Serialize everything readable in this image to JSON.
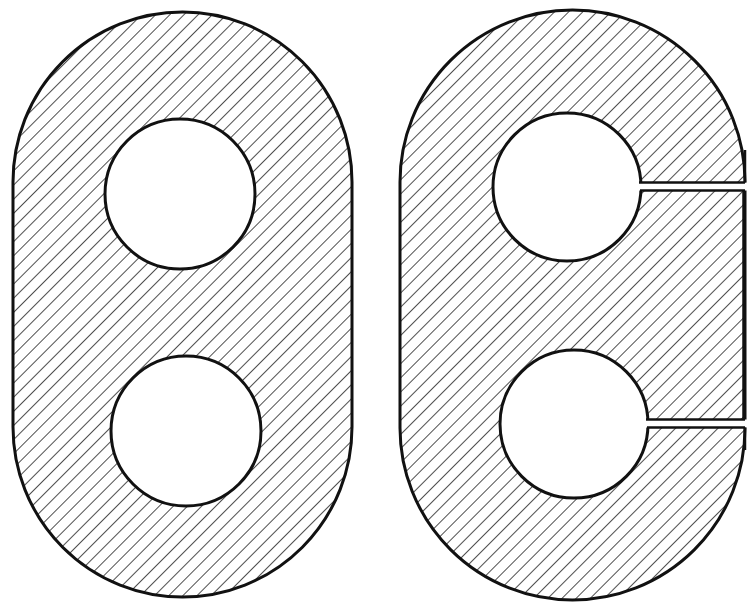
{
  "figure": {
    "colors": {
      "stroke": "#111111",
      "hatch": "#222222",
      "background": "#ffffff"
    },
    "hatch": {
      "angle_deg": -45,
      "spacing_px": 10
    }
  },
  "shapes": [
    {
      "id": "plate-left",
      "label": "",
      "holes": 2,
      "slits": 0
    },
    {
      "id": "plate-right",
      "label": "",
      "holes": 2,
      "slits": 2
    }
  ]
}
